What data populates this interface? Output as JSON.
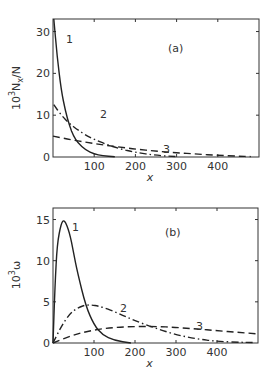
{
  "chart_data": [
    {
      "type": "line",
      "panel_label": "(a)",
      "xlabel": "x",
      "ylabel": "10³N_x/N",
      "ylabel_parts": {
        "base": "10",
        "exp": "3",
        "rest": "N",
        "sub": "x",
        "tail": "/N"
      },
      "xlim": [
        0,
        500
      ],
      "ylim": [
        0,
        33
      ],
      "x_ticks": [
        "100",
        "200",
        "300",
        "400"
      ],
      "y_ticks": [
        "0",
        "10",
        "20",
        "30"
      ],
      "grid": false,
      "series": [
        {
          "name": "1",
          "style": "solid",
          "x": [
            2,
            10,
            20,
            30,
            40,
            50,
            60,
            80,
            100,
            120,
            150
          ],
          "y": [
            33,
            24,
            16,
            11,
            7.5,
            5,
            3.4,
            1.6,
            0.7,
            0.3,
            0.05
          ]
        },
        {
          "name": "2",
          "style": "dash-dot",
          "x": [
            2,
            20,
            40,
            60,
            80,
            100,
            130,
            160,
            200,
            250,
            300
          ],
          "y": [
            12.5,
            10,
            8,
            6.5,
            5.2,
            4.2,
            3,
            2,
            1.1,
            0.4,
            0.1
          ]
        },
        {
          "name": "3",
          "style": "dashed",
          "x": [
            0,
            50,
            100,
            150,
            200,
            250,
            300,
            350,
            400,
            450,
            480
          ],
          "y": [
            5,
            4,
            3.2,
            2.5,
            1.9,
            1.4,
            1.0,
            0.7,
            0.4,
            0.2,
            0.1
          ]
        }
      ]
    },
    {
      "type": "line",
      "panel_label": "(b)",
      "xlabel": "x",
      "ylabel": "10³ω",
      "ylabel_parts": {
        "base": "10",
        "exp": "3",
        "rest": "ω"
      },
      "xlim": [
        0,
        500
      ],
      "ylim": [
        0,
        16
      ],
      "x_ticks": [
        "100",
        "200",
        "300",
        "400"
      ],
      "y_ticks": [
        "0",
        "5",
        "10",
        "15"
      ],
      "grid": false,
      "series": [
        {
          "name": "1",
          "style": "solid",
          "x": [
            0,
            5,
            10,
            20,
            28,
            40,
            50,
            60,
            80,
            100,
            120,
            150,
            190
          ],
          "y": [
            0,
            7,
            12,
            14.6,
            15,
            13.5,
            11,
            8.5,
            4.5,
            2.2,
            1.0,
            0.3,
            0
          ]
        },
        {
          "name": "2",
          "style": "dash-dot",
          "x": [
            0,
            20,
            40,
            60,
            85,
            120,
            160,
            200,
            250,
            300,
            350,
            400,
            450,
            490
          ],
          "y": [
            0,
            2,
            3.5,
            4.3,
            4.7,
            4.4,
            3.6,
            2.7,
            1.8,
            1.0,
            0.5,
            0.2,
            0.1,
            0.05
          ]
        },
        {
          "name": "3",
          "style": "dashed",
          "x": [
            0,
            50,
            100,
            150,
            200,
            250,
            300,
            350,
            400,
            450,
            500
          ],
          "y": [
            0,
            1.0,
            1.6,
            1.9,
            2.0,
            2.0,
            1.9,
            1.7,
            1.5,
            1.3,
            1.1
          ]
        }
      ]
    }
  ]
}
